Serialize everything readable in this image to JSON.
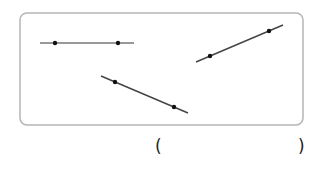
{
  "figure": {
    "frame": {
      "x": 20,
      "y": 13,
      "width": 283,
      "height": 112,
      "radius": 7,
      "stroke": "#b5b5b5"
    },
    "lines": [
      {
        "name": "horizontal-line",
        "x1": 40,
        "y1": 43,
        "x2": 134,
        "y2": 43,
        "stroke": "#777777",
        "points": [
          {
            "x": 55,
            "y": 43
          },
          {
            "x": 118,
            "y": 43
          }
        ]
      },
      {
        "name": "descending-line",
        "x1": 101,
        "y1": 76,
        "x2": 188,
        "y2": 113,
        "stroke": "#444444",
        "points": [
          {
            "x": 115,
            "y": 82
          },
          {
            "x": 174,
            "y": 107
          }
        ]
      },
      {
        "name": "ascending-line",
        "x1": 196,
        "y1": 62,
        "x2": 283,
        "y2": 25,
        "stroke": "#444444",
        "points": [
          {
            "x": 210,
            "y": 56
          },
          {
            "x": 269,
            "y": 31
          }
        ]
      }
    ]
  },
  "answer": {
    "open_paren": "(",
    "close_paren": ")",
    "value": ""
  }
}
